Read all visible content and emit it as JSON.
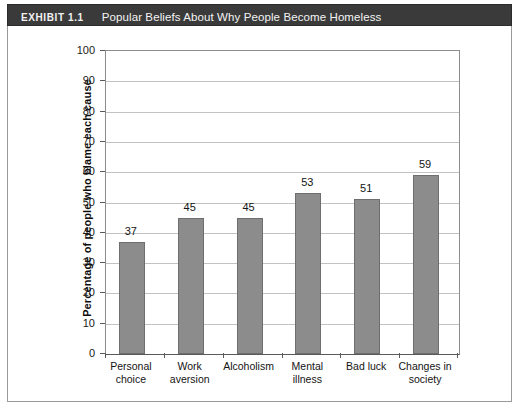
{
  "exhibit": {
    "label": "EXHIBIT 1.1",
    "title": "Popular Beliefs About Why People Become Homeless",
    "header_background": "#3a3a3a",
    "header_text_color": "#f4f4f4"
  },
  "chart_data": {
    "type": "bar",
    "title": "Popular Beliefs About Why People Become Homeless",
    "xlabel": "",
    "ylabel": "Percentage of people who blame each cause",
    "categories": [
      "Personal\nchoice",
      "Work\naversion",
      "Alcoholism",
      "Mental\nillness",
      "Bad luck",
      "Changes in\nsociety"
    ],
    "values": [
      37,
      45,
      45,
      53,
      51,
      59
    ],
    "ylim": [
      0,
      100
    ],
    "yticks": [
      0,
      10,
      20,
      30,
      40,
      50,
      60,
      70,
      80,
      90,
      100
    ],
    "ytick_labels": [
      "0",
      "10",
      "20",
      "30",
      "40",
      "50",
      "60",
      "70",
      "80",
      "90",
      "100"
    ],
    "grid": true,
    "legend": null,
    "bar_color": "#8c8c8c",
    "bar_border_color": "#6e6e6e",
    "gridline_color": "#c2c2c2"
  }
}
